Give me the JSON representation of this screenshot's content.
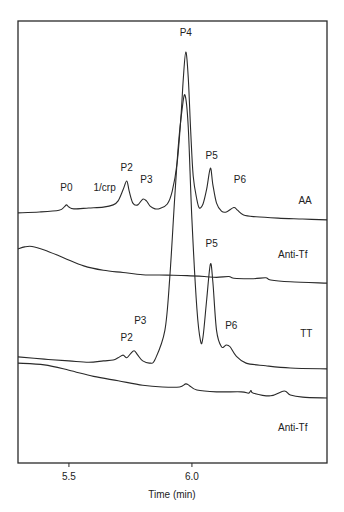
{
  "chart_data": {
    "type": "line",
    "title": "",
    "xlabel": "Time (min)",
    "ylabel": "",
    "xlim": [
      5.293,
      6.549
    ],
    "ylim": [
      0,
      100
    ],
    "y_units": "relative signal (stacked traces, arbitrary units)",
    "grid": false,
    "legend": "none (traces labeled inline at right)",
    "x_ticks": [
      {
        "value": 5.5,
        "label": "5.5"
      },
      {
        "value": 6.0,
        "label": "6.0"
      }
    ],
    "series": [
      {
        "name": "AA",
        "label": "AA",
        "label_pos": {
          "x": 6.46,
          "y": 58.6
        },
        "points": [
          [
            5.293,
            56.6
          ],
          [
            5.38,
            56.8
          ],
          [
            5.46,
            57.2
          ],
          [
            5.48,
            57.9
          ],
          [
            5.49,
            58.4
          ],
          [
            5.5,
            57.9
          ],
          [
            5.52,
            57.5
          ],
          [
            5.58,
            57.7
          ],
          [
            5.64,
            57.9
          ],
          [
            5.68,
            58.4
          ],
          [
            5.7,
            59.3
          ],
          [
            5.72,
            61.8
          ],
          [
            5.735,
            63.8
          ],
          [
            5.745,
            61.5
          ],
          [
            5.76,
            58.8
          ],
          [
            5.78,
            58.4
          ],
          [
            5.8,
            59.7
          ],
          [
            5.815,
            59.3
          ],
          [
            5.83,
            58.1
          ],
          [
            5.85,
            57.5
          ],
          [
            5.87,
            57.6
          ],
          [
            5.9,
            58.6
          ],
          [
            5.92,
            61.5
          ],
          [
            5.94,
            68.0
          ],
          [
            5.955,
            78.0
          ],
          [
            5.965,
            87.0
          ],
          [
            5.975,
            93.0
          ],
          [
            5.985,
            87.2
          ],
          [
            5.995,
            75.0
          ],
          [
            6.005,
            65.0
          ],
          [
            6.02,
            59.6
          ],
          [
            6.03,
            57.7
          ],
          [
            6.045,
            58.6
          ],
          [
            6.06,
            62.0
          ],
          [
            6.075,
            66.7
          ],
          [
            6.085,
            63.0
          ],
          [
            6.1,
            58.8
          ],
          [
            6.12,
            57.0
          ],
          [
            6.14,
            56.8
          ],
          [
            6.17,
            57.8
          ],
          [
            6.185,
            57.2
          ],
          [
            6.21,
            56.1
          ],
          [
            6.26,
            55.7
          ],
          [
            6.35,
            55.4
          ],
          [
            6.45,
            55.2
          ],
          [
            6.549,
            55.0
          ]
        ],
        "peaks": [
          {
            "label": "P0",
            "time": 5.49,
            "label_pos": {
              "x": 5.49,
              "y": 61.5
            }
          },
          {
            "label": "1/crp",
            "time": 5.64,
            "label_pos": {
              "x": 5.645,
              "y": 61.5
            }
          },
          {
            "label": "P2",
            "time": 5.735,
            "label_pos": {
              "x": 5.735,
              "y": 66.1
            }
          },
          {
            "label": "P3",
            "time": 5.815,
            "label_pos": {
              "x": 5.815,
              "y": 63.3
            }
          },
          {
            "label": "P4",
            "time": 5.975,
            "label_pos": {
              "x": 5.975,
              "y": 96.6
            }
          },
          {
            "label": "P5",
            "time": 6.075,
            "label_pos": {
              "x": 6.08,
              "y": 68.8
            }
          },
          {
            "label": "P6",
            "time": 6.185,
            "label_pos": {
              "x": 6.195,
              "y": 63.3
            }
          }
        ]
      },
      {
        "name": "Anti-Tf (upper)",
        "label": "Anti-Tf",
        "label_pos": {
          "x": 6.41,
          "y": 46.4
        },
        "points": [
          [
            5.293,
            48.4
          ],
          [
            5.32,
            48.9
          ],
          [
            5.35,
            49.0
          ],
          [
            5.4,
            48.2
          ],
          [
            5.48,
            46.4
          ],
          [
            5.56,
            44.6
          ],
          [
            5.64,
            43.6
          ],
          [
            5.72,
            43.1
          ],
          [
            5.8,
            42.6
          ],
          [
            5.9,
            42.5
          ],
          [
            5.98,
            42.4
          ],
          [
            6.05,
            42.2
          ],
          [
            6.1,
            42.0
          ],
          [
            6.15,
            42.2
          ],
          [
            6.17,
            41.8
          ],
          [
            6.25,
            41.7
          ],
          [
            6.3,
            41.9
          ],
          [
            6.32,
            41.4
          ],
          [
            6.4,
            41.0
          ],
          [
            6.549,
            40.7
          ]
        ]
      },
      {
        "name": "TT",
        "label": "TT",
        "label_pos": {
          "x": 6.465,
          "y": 28.5
        },
        "points": [
          [
            5.293,
            24.0
          ],
          [
            5.4,
            23.5
          ],
          [
            5.5,
            23.1
          ],
          [
            5.58,
            22.8
          ],
          [
            5.64,
            23.1
          ],
          [
            5.68,
            23.3
          ],
          [
            5.7,
            23.8
          ],
          [
            5.72,
            24.4
          ],
          [
            5.735,
            23.8
          ],
          [
            5.75,
            24.7
          ],
          [
            5.765,
            25.4
          ],
          [
            5.78,
            24.4
          ],
          [
            5.8,
            23.1
          ],
          [
            5.83,
            22.6
          ],
          [
            5.85,
            23.4
          ],
          [
            5.89,
            30.0
          ],
          [
            5.91,
            42.0
          ],
          [
            5.93,
            60.0
          ],
          [
            5.945,
            72.0
          ],
          [
            5.96,
            80.0
          ],
          [
            5.972,
            83.2
          ],
          [
            5.985,
            76.0
          ],
          [
            6.0,
            55.0
          ],
          [
            6.02,
            35.0
          ],
          [
            6.035,
            27.6
          ],
          [
            6.045,
            28.5
          ],
          [
            6.06,
            37.0
          ],
          [
            6.075,
            45.0
          ],
          [
            6.085,
            41.0
          ],
          [
            6.1,
            30.0
          ],
          [
            6.12,
            26.3
          ],
          [
            6.14,
            26.7
          ],
          [
            6.155,
            26.3
          ],
          [
            6.18,
            24.2
          ],
          [
            6.22,
            22.6
          ],
          [
            6.3,
            22.0
          ],
          [
            6.4,
            21.5
          ],
          [
            6.549,
            21.3
          ]
        ],
        "peaks": [
          {
            "label": "P2",
            "time": 5.735,
            "label_pos": {
              "x": 5.735,
              "y": 27.6
            }
          },
          {
            "label": "P3",
            "time": 5.765,
            "label_pos": {
              "x": 5.79,
              "y": 31.4
            }
          },
          {
            "label": "P5",
            "time": 6.075,
            "label_pos": {
              "x": 6.08,
              "y": 48.9
            }
          },
          {
            "label": "P6",
            "time": 6.14,
            "label_pos": {
              "x": 6.16,
              "y": 30.3
            }
          }
        ]
      },
      {
        "name": "Anti-Tf (lower)",
        "label": "Anti-Tf",
        "label_pos": {
          "x": 6.41,
          "y": 7.2
        },
        "points": [
          [
            5.293,
            22.6
          ],
          [
            5.4,
            22.2
          ],
          [
            5.5,
            21.0
          ],
          [
            5.6,
            19.6
          ],
          [
            5.7,
            18.6
          ],
          [
            5.8,
            17.6
          ],
          [
            5.88,
            17.2
          ],
          [
            5.95,
            17.2
          ],
          [
            5.975,
            17.9
          ],
          [
            5.99,
            17.5
          ],
          [
            6.02,
            16.5
          ],
          [
            6.1,
            16.1
          ],
          [
            6.2,
            16.1
          ],
          [
            6.23,
            15.8
          ],
          [
            6.24,
            16.4
          ],
          [
            6.25,
            15.8
          ],
          [
            6.32,
            15.2
          ],
          [
            6.375,
            16.3
          ],
          [
            6.4,
            15.4
          ],
          [
            6.45,
            14.9
          ],
          [
            6.549,
            14.7
          ]
        ]
      }
    ]
  }
}
